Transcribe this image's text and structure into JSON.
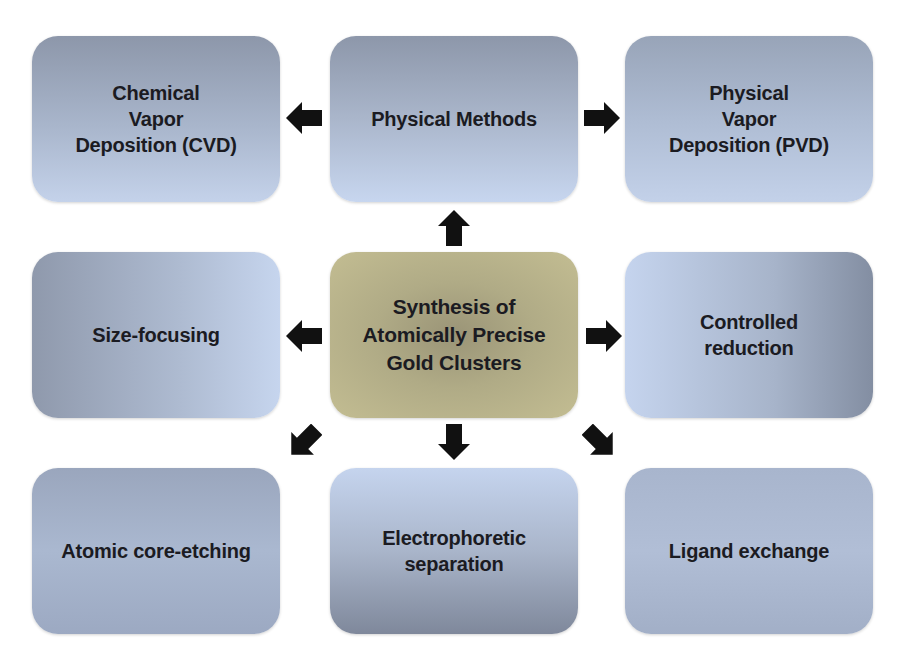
{
  "diagram": {
    "center": {
      "label": "Synthesis of\nAtomically Precise\nGold Clusters",
      "color": "#b3ad88"
    },
    "nodes": {
      "top_left": {
        "label": "Chemical\nVapor\nDeposition (CVD)"
      },
      "top_center": {
        "label": "Physical Methods"
      },
      "top_right": {
        "label": "Physical\nVapor\nDeposition (PVD)"
      },
      "middle_left": {
        "label": "Size-focusing"
      },
      "middle_right": {
        "label": "Controlled\nreduction"
      },
      "bottom_left": {
        "label": "Atomic core-etching"
      },
      "bottom_center": {
        "label": "Electrophoretic\nseparation"
      },
      "bottom_right": {
        "label": "Ligand exchange"
      }
    },
    "edges": [
      {
        "from": "center",
        "to": "top_center",
        "icon": "arrow-up-icon"
      },
      {
        "from": "top_center",
        "to": "top_left",
        "icon": "arrow-left-icon"
      },
      {
        "from": "top_center",
        "to": "top_right",
        "icon": "arrow-right-icon"
      },
      {
        "from": "center",
        "to": "middle_left",
        "icon": "arrow-left-icon"
      },
      {
        "from": "center",
        "to": "middle_right",
        "icon": "arrow-right-icon"
      },
      {
        "from": "center",
        "to": "bottom_left",
        "icon": "arrow-down-left-icon"
      },
      {
        "from": "center",
        "to": "bottom_center",
        "icon": "arrow-down-icon"
      },
      {
        "from": "center",
        "to": "bottom_right",
        "icon": "arrow-down-right-icon"
      }
    ],
    "box_color": "#aab7cd",
    "arrow_color": "#111111"
  }
}
